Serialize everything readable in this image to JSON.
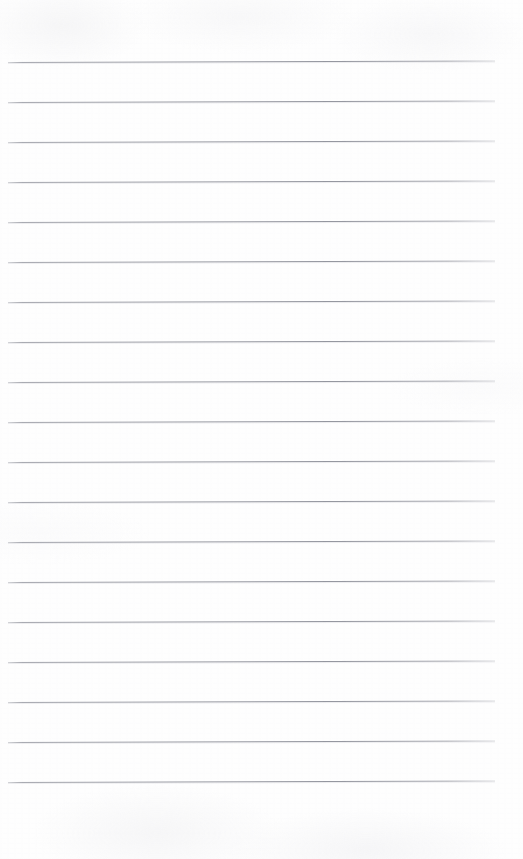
{
  "document": {
    "kind": "scanned-ruled-notebook-paper",
    "title": "",
    "visible_text": "",
    "page_width": 523,
    "page_height": 859,
    "background_color": "#fefefe",
    "has_handwriting": false,
    "has_margin_rule": false,
    "has_holes": false
  },
  "ruling": {
    "line_color": "#96989d",
    "line_thickness_px": 1,
    "line_count": 19,
    "spacing_px": 40,
    "first_line_y": 62,
    "left_x": 8,
    "right_x": 495,
    "line_width_px": 487,
    "tilt_degrees": -0.18,
    "top_margin_px": 62,
    "bottom_margin_px": 77,
    "lines": [
      {
        "index": 1,
        "y": 62,
        "x_start": 8,
        "x_end": 495
      },
      {
        "index": 2,
        "y": 102,
        "x_start": 8,
        "x_end": 495
      },
      {
        "index": 3,
        "y": 142,
        "x_start": 8,
        "x_end": 495
      },
      {
        "index": 4,
        "y": 182,
        "x_start": 8,
        "x_end": 495
      },
      {
        "index": 5,
        "y": 222,
        "x_start": 8,
        "x_end": 495
      },
      {
        "index": 6,
        "y": 262,
        "x_start": 8,
        "x_end": 495
      },
      {
        "index": 7,
        "y": 302,
        "x_start": 8,
        "x_end": 495
      },
      {
        "index": 8,
        "y": 342,
        "x_start": 8,
        "x_end": 495
      },
      {
        "index": 9,
        "y": 382,
        "x_start": 8,
        "x_end": 495
      },
      {
        "index": 10,
        "y": 422,
        "x_start": 8,
        "x_end": 495
      },
      {
        "index": 11,
        "y": 462,
        "x_start": 8,
        "x_end": 495
      },
      {
        "index": 12,
        "y": 502,
        "x_start": 8,
        "x_end": 495
      },
      {
        "index": 13,
        "y": 542,
        "x_start": 8,
        "x_end": 495
      },
      {
        "index": 14,
        "y": 582,
        "x_start": 8,
        "x_end": 495
      },
      {
        "index": 15,
        "y": 622,
        "x_start": 8,
        "x_end": 495
      },
      {
        "index": 16,
        "y": 662,
        "x_start": 8,
        "x_end": 495
      },
      {
        "index": 17,
        "y": 702,
        "x_start": 8,
        "x_end": 495
      },
      {
        "index": 18,
        "y": 742,
        "x_start": 8,
        "x_end": 495
      },
      {
        "index": 19,
        "y": 782,
        "x_start": 8,
        "x_end": 495
      }
    ]
  }
}
